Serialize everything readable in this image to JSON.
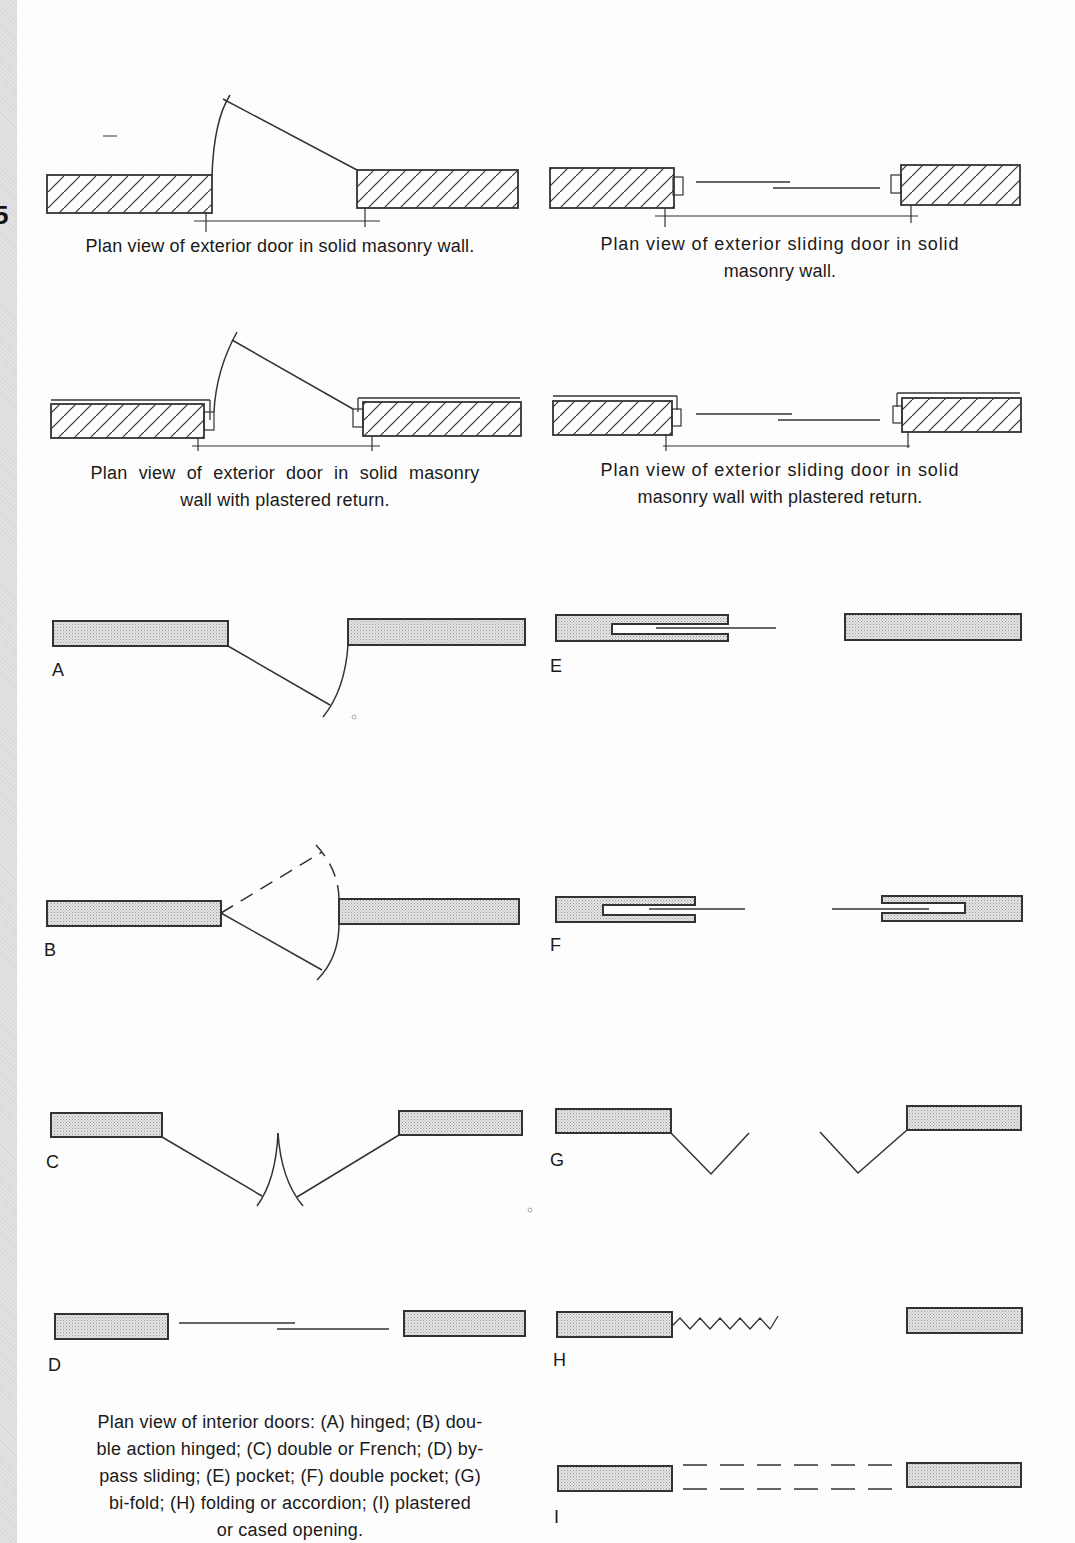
{
  "page": {
    "page_marker": "5"
  },
  "exterior": {
    "hinged_solid": {
      "caption": "Plan view of exterior door in solid masonry wall."
    },
    "sliding_solid": {
      "caption_line1": "Plan view of exterior sliding door in solid",
      "caption_line2": "masonry wall."
    },
    "hinged_plastered": {
      "caption_line1": "Plan view of exterior door in solid masonry",
      "caption_line2": "wall with plastered return."
    },
    "sliding_plastered": {
      "caption_line1": "Plan view of exterior sliding door in solid",
      "caption_line2": "masonry wall with plastered return."
    }
  },
  "interior": {
    "labels": {
      "A": "A",
      "B": "B",
      "C": "C",
      "D": "D",
      "E": "E",
      "F": "F",
      "G": "G",
      "H": "H",
      "I": "I"
    },
    "caption_lines": [
      "Plan view of interior doors: (A) hinged; (B) dou-",
      "ble action hinged; (C) double or French; (D) by-",
      "pass sliding; (E) pocket; (F) double pocket; (G)",
      "bi-fold; (H) folding or accordion; (I) plastered",
      "or cased opening."
    ],
    "types": [
      {
        "key": "A",
        "name": "hinged"
      },
      {
        "key": "B",
        "name": "double action hinged"
      },
      {
        "key": "C",
        "name": "double or French"
      },
      {
        "key": "D",
        "name": "by-pass sliding"
      },
      {
        "key": "E",
        "name": "pocket"
      },
      {
        "key": "F",
        "name": "double pocket"
      },
      {
        "key": "G",
        "name": "bi-fold"
      },
      {
        "key": "H",
        "name": "folding or accordion"
      },
      {
        "key": "I",
        "name": "plastered or cased opening"
      }
    ]
  },
  "colors": {
    "line": "#333333",
    "wall_fill": "#d9d9d9",
    "paper": "#fdfdfd",
    "margin": "#dddddd"
  }
}
